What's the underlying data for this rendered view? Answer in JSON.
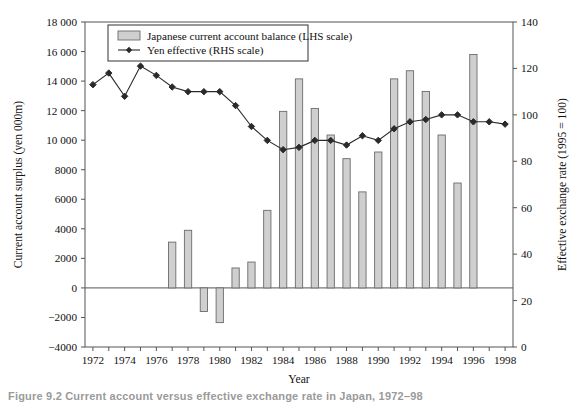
{
  "caption": "Figure 9.2  Current account versus effective exchange rate in Japan, 1972–98",
  "legend": {
    "bar_label": "Japanese current account balance (LHS scale)",
    "line_label": "Yen effective (RHS scale)"
  },
  "axes": {
    "xlabel": "Year",
    "ylabel_left": "Current account surplus (yen 000m)",
    "ylabel_right": "Effective exchange rate (1995 = 100)",
    "left_ticks": [
      "18 000",
      "16 000",
      "14 000",
      "12 000",
      "10 000",
      "8000",
      "6000",
      "4000",
      "2000",
      "0",
      "−2000",
      "−4000"
    ],
    "right_ticks": [
      "140",
      "120",
      "100",
      "80",
      "60",
      "40",
      "20",
      "0"
    ],
    "x_ticks": [
      "1972",
      "1974",
      "1976",
      "1978",
      "1980",
      "1982",
      "1984",
      "1986",
      "1988",
      "1990",
      "1992",
      "1994",
      "1996",
      "1998"
    ]
  },
  "style": {
    "bar_fill": "#cfcfcf",
    "bar_edge": "#6b6b6b",
    "line_color": "#2a2a2a",
    "axis_color": "#555555"
  },
  "chart_data": {
    "type": "bar",
    "title": "Current account versus effective exchange rate in Japan, 1972–98",
    "xlabel": "Year",
    "ylabel": "Current account surplus (yen 000m)",
    "ylabel_secondary": "Effective exchange rate (1995 = 100)",
    "ylim": [
      -4000,
      18000
    ],
    "ylim_secondary": [
      0,
      140
    ],
    "grid": false,
    "legend_position": "top-left",
    "categories": [
      1972,
      1973,
      1974,
      1975,
      1976,
      1977,
      1978,
      1979,
      1980,
      1981,
      1982,
      1983,
      1984,
      1985,
      1986,
      1987,
      1988,
      1989,
      1990,
      1991,
      1992,
      1993,
      1994,
      1995,
      1996,
      1997,
      1998
    ],
    "series": [
      {
        "name": "Japanese current account balance (LHS scale)",
        "axis": "left",
        "type": "bar",
        "units": "yen 000m",
        "values": [
          0,
          0,
          0,
          0,
          0,
          3100,
          3900,
          -1600,
          -2350,
          1350,
          1750,
          5250,
          11950,
          14150,
          12150,
          10350,
          8750,
          6500,
          9200,
          14150,
          14700,
          13300,
          10350,
          7100,
          15800,
          null,
          null
        ]
      },
      {
        "name": "Yen effective (RHS scale)",
        "axis": "right",
        "type": "line",
        "units": "1995 = 100",
        "values": [
          113,
          118,
          108,
          121,
          117,
          112,
          110,
          110,
          110,
          104,
          95,
          89,
          85,
          86,
          89,
          89,
          87,
          91,
          89,
          94,
          97,
          98,
          100,
          100,
          97,
          97,
          96
        ]
      }
    ]
  }
}
